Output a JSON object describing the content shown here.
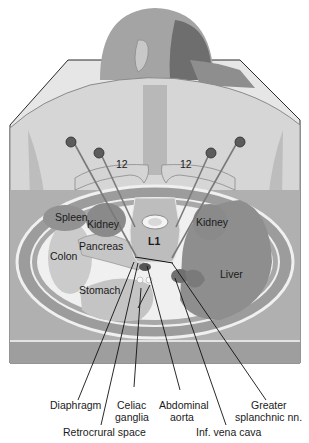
{
  "figure": {
    "type": "anatomical-illustration",
    "view": "cross-section of abdomen at L1 with posterior needle approach",
    "colors": {
      "background": "#ffffff",
      "skin_back": "#d8d8d8",
      "skin_head": "#9a9a9a",
      "hair": "#6e6e6e",
      "body_wall": "#a8a8a8",
      "organ_dark": "#8c8c8c",
      "organ_light": "#c4c4c4",
      "fat": "#f2f2f2",
      "table": "#9e9e9e",
      "leader_line": "#111111"
    }
  },
  "structures": {
    "rib_left": "12",
    "rib_right": "12",
    "vertebra": "L1",
    "spleen": "Spleen",
    "kidney_left": "Kidney",
    "kidney_right": "Kidney",
    "pancreas": "Pancreas",
    "colon": "Colon",
    "stomach": "Stomach",
    "liver": "Liver"
  },
  "callouts": [
    {
      "id": "diaphragm",
      "lines": [
        "Diaphragm"
      ]
    },
    {
      "id": "retrocrural",
      "lines": [
        "Retrocrural space"
      ]
    },
    {
      "id": "celiac",
      "lines": [
        "Celiac",
        "ganglia"
      ]
    },
    {
      "id": "aorta",
      "lines": [
        "Abdominal",
        "aorta"
      ]
    },
    {
      "id": "ivc",
      "lines": [
        "Inf. vena cava"
      ]
    },
    {
      "id": "splanchnic",
      "lines": [
        "Greater",
        "splanchnic nn."
      ]
    }
  ]
}
